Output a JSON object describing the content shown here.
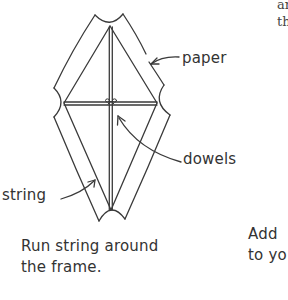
{
  "page": {
    "type": "instructional-book-page",
    "topic": "kite building"
  },
  "diagram": {
    "labels": {
      "paper": "paper",
      "dowels": "dowels",
      "string": "string"
    },
    "colors": {
      "line": "#3a3a3a",
      "background": "#ffffff"
    }
  },
  "captions": {
    "main": {
      "line1": "Run string around",
      "line2": "the frame."
    },
    "right_cut_off": {
      "line1": "Add",
      "line2": "to yo"
    }
  },
  "top_right_fragment": {
    "line1": "an",
    "line2": "th"
  }
}
